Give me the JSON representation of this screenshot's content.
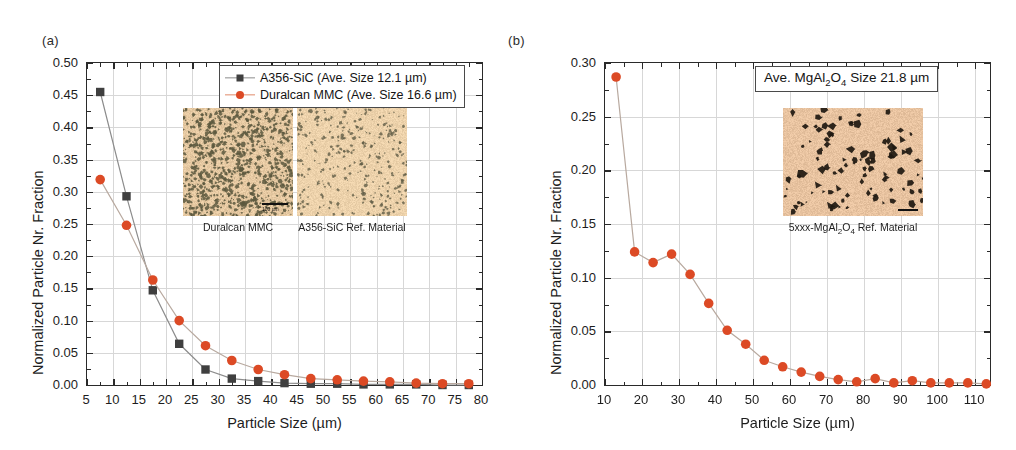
{
  "figure": {
    "panel_a_label": "(a)",
    "panel_b_label": "(b)"
  },
  "panel_a": {
    "axis_x_title": "Particle Size (µm)",
    "axis_y_title": "Normalized Particle Nr. Fraction",
    "legend": {
      "series1": "A356-SiC (Ave. Size 12.1 µm)",
      "series2": "Duralcan MMC (Ave. Size 16.6 µm)"
    },
    "insets": [
      {
        "caption": "Duralcan MMC",
        "scalebar": "100 µm"
      },
      {
        "caption": "A356-SiC Ref. Material"
      }
    ]
  },
  "panel_b": {
    "axis_x_title": "Particle Size (µm)",
    "axis_y_title": "Normalized Particle Nr. Fraction",
    "title_box_pre": "Ave. MgAl",
    "title_box_sub1": "2",
    "title_box_mid": "O",
    "title_box_sub2": "4",
    "title_box_post": " Size 21.8 µm",
    "inset": {
      "caption_pre": "5xxx-MgAl",
      "caption_sub1": "2",
      "caption_mid": "O",
      "caption_sub2": "4",
      "caption_post": " Ref. Material"
    }
  },
  "colors": {
    "series_square": "#3f3f3f",
    "series_circle": "#dc4a25",
    "line_gray": "#8c8c8c",
    "axis": "#2a2a2a",
    "grid": "#d7d7d7",
    "inset_bg": "#e8c9a0"
  },
  "chart_data": [
    {
      "type": "line",
      "panel": "(a)",
      "title": "",
      "xlabel": "Particle Size (µm)",
      "ylabel": "Normalized Particle Nr. Fraction",
      "xlim": [
        5,
        80
      ],
      "ylim": [
        0.0,
        0.5
      ],
      "xticks": [
        5,
        10,
        15,
        20,
        25,
        30,
        35,
        40,
        45,
        50,
        55,
        60,
        65,
        70,
        75,
        80
      ],
      "yticks": [
        0.0,
        0.05,
        0.1,
        0.15,
        0.2,
        0.25,
        0.3,
        0.35,
        0.4,
        0.45,
        0.5
      ],
      "grid": true,
      "legend_position": "top-right",
      "x": [
        7.5,
        12.5,
        17.5,
        22.5,
        27.5,
        32.5,
        37.5,
        42.5,
        47.5,
        52.5,
        57.5,
        62.5,
        67.5,
        72.5,
        77.5
      ],
      "series": [
        {
          "name": "A356-SiC (Ave. Size 12.1 µm)",
          "marker": "square",
          "color": "#3f3f3f",
          "values": [
            0.455,
            0.293,
            0.147,
            0.064,
            0.024,
            0.01,
            0.006,
            0.003,
            0.002,
            0.002,
            0.001,
            0.001,
            0.001,
            0.0,
            0.0
          ]
        },
        {
          "name": "Duralcan MMC (Ave. Size 16.6 µm)",
          "marker": "circle",
          "color": "#dc4a25",
          "values": [
            0.319,
            0.248,
            0.163,
            0.1,
            0.061,
            0.038,
            0.024,
            0.016,
            0.01,
            0.008,
            0.006,
            0.005,
            0.003,
            0.002,
            0.002
          ]
        }
      ]
    },
    {
      "type": "line",
      "panel": "(b)",
      "title": "Ave. MgAl2O4 Size 21.8 µm",
      "xlabel": "Particle Size (µm)",
      "ylabel": "Normalized Particle Nr. Fraction",
      "xlim": [
        10,
        114
      ],
      "ylim": [
        0.0,
        0.3
      ],
      "xticks": [
        10,
        20,
        30,
        40,
        50,
        60,
        70,
        80,
        90,
        100,
        110
      ],
      "yticks": [
        0.0,
        0.05,
        0.1,
        0.15,
        0.2,
        0.25,
        0.3
      ],
      "grid": true,
      "legend_position": "none",
      "x": [
        13,
        18,
        23,
        28,
        33,
        38,
        43,
        48,
        53,
        58,
        63,
        68,
        73,
        78,
        83,
        88,
        93,
        98,
        103,
        108,
        113
      ],
      "series": [
        {
          "name": "5xxx-MgAl2O4",
          "marker": "circle",
          "color": "#dc4a25",
          "values": [
            0.287,
            0.124,
            0.114,
            0.122,
            0.103,
            0.076,
            0.051,
            0.038,
            0.023,
            0.017,
            0.012,
            0.008,
            0.005,
            0.003,
            0.006,
            0.002,
            0.004,
            0.002,
            0.002,
            0.002,
            0.001
          ]
        }
      ]
    }
  ]
}
